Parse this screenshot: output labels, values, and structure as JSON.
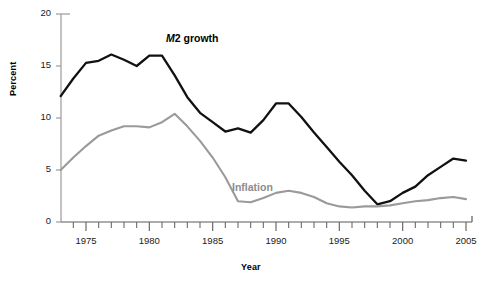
{
  "chart_data": {
    "type": "line",
    "title": "",
    "xlabel": "Year",
    "ylabel": "Percent",
    "xlim": [
      1973,
      2005.5
    ],
    "ylim": [
      0,
      20
    ],
    "yticks": [
      0,
      5,
      10,
      15,
      20
    ],
    "ytick_labels": [
      "0",
      "5",
      "10",
      "15",
      "20"
    ],
    "xticks": [
      1975,
      1980,
      1985,
      1990,
      1995,
      2000,
      2005
    ],
    "xtick_labels": [
      "1975",
      "1980",
      "1985",
      "1990",
      "1995",
      "2000",
      "2005"
    ],
    "minor_xticks_every": 1,
    "grid": false,
    "legend_position": "inline-annotations",
    "x": [
      1973,
      1974,
      1975,
      1976,
      1977,
      1978,
      1979,
      1980,
      1981,
      1982,
      1983,
      1984,
      1985,
      1986,
      1987,
      1988,
      1989,
      1990,
      1991,
      1992,
      1993,
      1994,
      1995,
      1996,
      1997,
      1998,
      1999,
      2000,
      2001,
      2002,
      2003,
      2004,
      2005
    ],
    "series": [
      {
        "name": "M2 growth",
        "color": "#111111",
        "label": "M2 growth",
        "label_prefix_italic": "M",
        "label_rest": "2 growth",
        "values": [
          12.1,
          13.8,
          15.3,
          15.5,
          16.1,
          15.6,
          15.0,
          16.0,
          16.0,
          14.1,
          12.0,
          10.5,
          9.6,
          8.7,
          9.0,
          8.6,
          9.8,
          11.4,
          11.4,
          10.1,
          8.6,
          7.2,
          5.8,
          4.5,
          3.0,
          1.7,
          2.0,
          2.8,
          3.4,
          4.5,
          5.3,
          6.1,
          5.9
        ]
      },
      {
        "name": "Inflation",
        "color": "#9a9a9a",
        "label": "Inflation",
        "values": [
          5.0,
          6.2,
          7.3,
          8.3,
          8.8,
          9.2,
          9.2,
          9.1,
          9.6,
          10.4,
          9.2,
          7.8,
          6.2,
          4.3,
          2.0,
          1.9,
          2.3,
          2.8,
          3.0,
          2.8,
          2.4,
          1.8,
          1.5,
          1.4,
          1.5,
          1.5,
          1.6,
          1.8,
          2.0,
          2.1,
          2.3,
          2.4,
          2.2
        ]
      }
    ]
  },
  "axes": {
    "ylabel_text": "Percent",
    "xlabel_text": "Year"
  }
}
